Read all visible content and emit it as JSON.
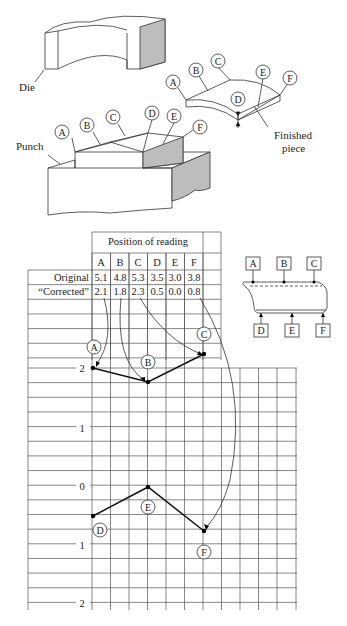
{
  "illustration": {
    "die_label": "Die",
    "punch_label": "Punch",
    "finished_label_line1": "Finished",
    "finished_label_line2": "piece",
    "punch_points": [
      "A",
      "B",
      "C",
      "D",
      "E",
      "F"
    ],
    "piece_points": [
      "A",
      "B",
      "C",
      "D",
      "E",
      "F"
    ]
  },
  "table": {
    "header": "Position of reading",
    "columns": [
      "A",
      "B",
      "C",
      "D",
      "E",
      "F"
    ],
    "rows": [
      {
        "label": "Original",
        "values": [
          "5.1",
          "4.8",
          "5.3",
          "3.5",
          "3.0",
          "3.8"
        ]
      },
      {
        "label": "“Corrected”",
        "values": [
          "2.1",
          "1.8",
          "2.3",
          "0.5",
          "0.0",
          "0.8"
        ]
      }
    ]
  },
  "inset": {
    "top_labels": [
      "A",
      "B",
      "C"
    ],
    "bottom_labels": [
      "D",
      "E",
      "F"
    ]
  },
  "chart_data": {
    "type": "line",
    "title": "",
    "upper_axis": {
      "ticks": [
        "2",
        "1"
      ],
      "series": [
        {
          "name": "A-B-C",
          "points": [
            {
              "label": "A",
              "x": "A",
              "y": 2.1
            },
            {
              "label": "B",
              "x": "B",
              "y": 1.8
            },
            {
              "label": "C",
              "x": "C",
              "y": 2.3
            }
          ]
        }
      ]
    },
    "lower_axis": {
      "ticks": [
        "0",
        "1",
        "2"
      ],
      "series": [
        {
          "name": "D-E-F",
          "points": [
            {
              "label": "D",
              "x": "D",
              "y": 0.5
            },
            {
              "label": "E",
              "x": "E",
              "y": 0.0
            },
            {
              "label": "F",
              "x": "F",
              "y": 0.8
            }
          ]
        }
      ]
    },
    "grid": true
  }
}
